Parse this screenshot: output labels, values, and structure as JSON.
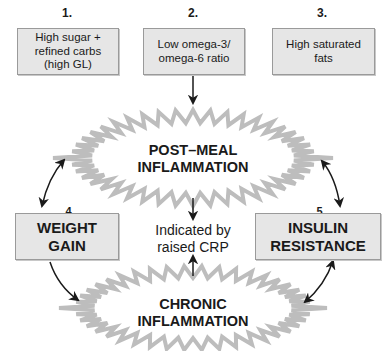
{
  "diagram": {
    "factors": [
      {
        "number": "1.",
        "label": "High sugar +\nrefined carbs\n(high GL)"
      },
      {
        "number": "2.",
        "label": "Low omega-3/\nomega-6 ratio"
      },
      {
        "number": "3.",
        "label": "High saturated\nfats"
      }
    ],
    "post_meal": {
      "label": "POST–MEAL\nINFLAMMATION"
    },
    "weight_gain": {
      "number": "4.",
      "label": "WEIGHT\nGAIN"
    },
    "insulin_resistance": {
      "number": "5.",
      "label": "INSULIN\nRESISTANCE"
    },
    "crp_note": {
      "label": "Indicated by\nraised CRP"
    },
    "chronic": {
      "label": "CHRONIC\nINFLAMMATION"
    },
    "colors": {
      "box_fill": "#e6e6e6",
      "box_border": "#9a9a9a",
      "burst_stroke": "#bdbdbd",
      "arrow": "#1a1a1a"
    }
  }
}
